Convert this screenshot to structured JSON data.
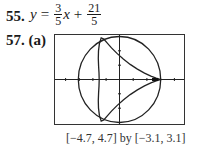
{
  "problem55": {
    "number": "55.",
    "lhs": "y",
    "equals": "=",
    "frac1_num": "3",
    "frac1_den": "5",
    "var": "x",
    "plus": "+",
    "frac2_num": "21",
    "frac2_den": "5"
  },
  "problem57": {
    "number": "57. (a)",
    "window_caption": "[−4.7, 4.7] by [−3.1, 3.1]",
    "graph": {
      "xmin": -4.7,
      "xmax": 4.7,
      "ymin": -3.1,
      "ymax": 3.1,
      "description": "Circle of radius 3 centered at origin with inscribed three-cusped curve (deltoid) with cusp at (3,0)"
    }
  }
}
